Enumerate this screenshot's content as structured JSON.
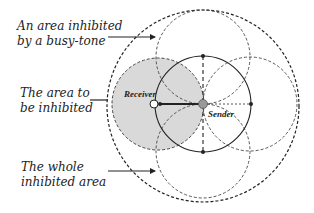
{
  "labels": {
    "busy_tone": {
      "line1": "An area inhibited",
      "line2": "by a busy-tone"
    },
    "to_be_inhibited": {
      "line1": "The area to",
      "line2": "be inhibited"
    },
    "whole": {
      "line1": "The whole",
      "line2": "inhibited area"
    },
    "receiver": "Receiver",
    "sender": "Sender"
  },
  "colors": {
    "shade": "#d9d9d9",
    "line": "#222222",
    "node": "#9a9a9a"
  }
}
